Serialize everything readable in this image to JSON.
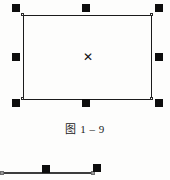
{
  "figure": {
    "caption": "图 1 – 9",
    "background_color": "#fdfdfc",
    "stroke_color": "#1b1b1b",
    "handle_color": "#0d0d0d",
    "center_marker_glyph": "✕"
  },
  "selected_object": {
    "type": "rectangle",
    "label": "selected-rectangle",
    "handle_count": 8,
    "handles": [
      {
        "name": "top-left",
        "position": "nw"
      },
      {
        "name": "top-center",
        "position": "n"
      },
      {
        "name": "top-right",
        "position": "ne"
      },
      {
        "name": "middle-left",
        "position": "w"
      },
      {
        "name": "middle-right",
        "position": "e"
      },
      {
        "name": "bottom-left",
        "position": "sw"
      },
      {
        "name": "bottom-center",
        "position": "s"
      },
      {
        "name": "bottom-right",
        "position": "se"
      }
    ],
    "vertices": [
      {
        "name": "vertex-top-left"
      },
      {
        "name": "vertex-top-right"
      },
      {
        "name": "vertex-bottom-left"
      },
      {
        "name": "vertex-bottom-right"
      }
    ]
  },
  "partial_object": {
    "type": "line",
    "label": "selected-line-partial",
    "line_color": "#3d3d3d",
    "endpoint_color": "#9a9a9a",
    "handles": [
      {
        "name": "line-midpoint"
      },
      {
        "name": "line-endpoint"
      }
    ]
  }
}
